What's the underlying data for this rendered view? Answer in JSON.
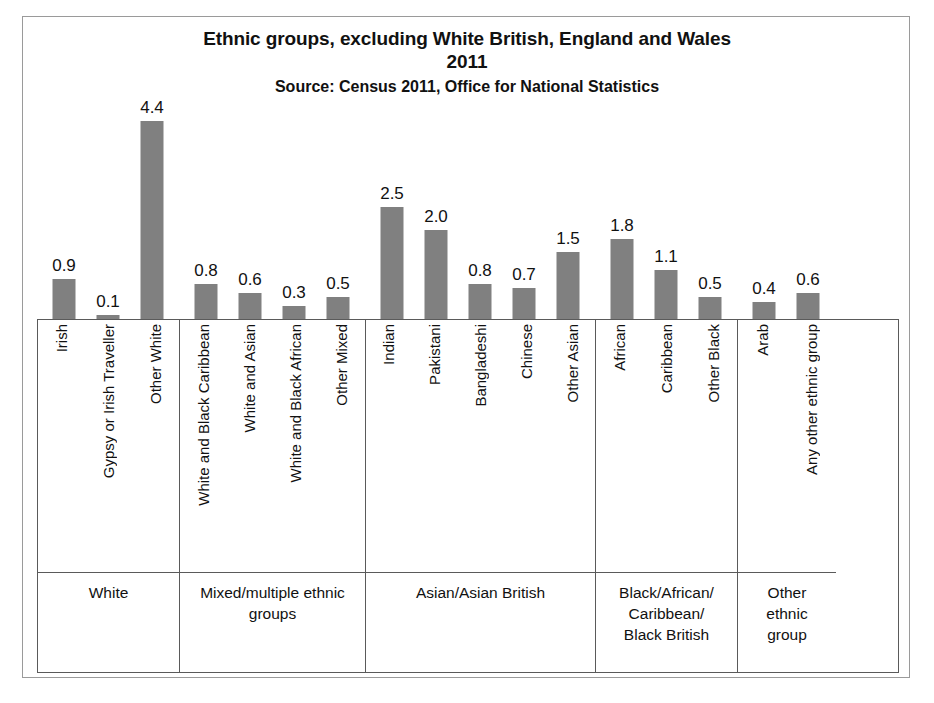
{
  "chart_data": {
    "type": "bar",
    "title": "Ethnic groups, excluding White British, England and Wales\n2011",
    "subtitle": "Source: Census 2011, Office for National Statistics",
    "xlabel": "",
    "ylabel": "",
    "ylim": [
      0,
      4.4
    ],
    "grid": false,
    "legend": "none",
    "value_format": "one-decimal percentage",
    "bar_color": "#808080",
    "categories": [
      "Irish",
      "Gypsy or Irish Traveller",
      "Other White",
      "White and Black Caribbean",
      "White and Asian",
      "White and Black African",
      "Other Mixed",
      "Indian",
      "Pakistani",
      "Bangladeshi",
      "Chinese",
      "Other Asian",
      "African",
      "Caribbean",
      "Other Black",
      "Arab",
      "Any other ethnic group"
    ],
    "values": [
      0.9,
      0.1,
      4.4,
      0.8,
      0.6,
      0.3,
      0.5,
      2.5,
      2.0,
      0.8,
      0.7,
      1.5,
      1.8,
      1.1,
      0.5,
      0.4,
      0.6
    ],
    "value_labels": [
      "0.9",
      "0.1",
      "4.4",
      "0.8",
      "0.6",
      "0.3",
      "0.5",
      "2.5",
      "2.0",
      "0.8",
      "0.7",
      "1.5",
      "1.8",
      "1.1",
      "0.5",
      "0.4",
      "0.6"
    ],
    "groups": [
      {
        "label": "White",
        "categories": [
          "Irish",
          "Gypsy or Irish Traveller",
          "Other White"
        ],
        "values": [
          0.9,
          0.1,
          4.4
        ],
        "value_labels": [
          "0.9",
          "0.1",
          "4.4"
        ]
      },
      {
        "label": "Mixed/multiple ethnic\ngroups",
        "categories": [
          "White and Black Caribbean",
          "White and Asian",
          "White and Black African",
          "Other Mixed"
        ],
        "values": [
          0.8,
          0.6,
          0.3,
          0.5
        ],
        "value_labels": [
          "0.8",
          "0.6",
          "0.3",
          "0.5"
        ]
      },
      {
        "label": "Asian/Asian British",
        "categories": [
          "Indian",
          "Pakistani",
          "Bangladeshi",
          "Chinese",
          "Other Asian"
        ],
        "values": [
          2.5,
          2.0,
          0.8,
          0.7,
          1.5
        ],
        "value_labels": [
          "2.5",
          "2.0",
          "0.8",
          "0.7",
          "1.5"
        ]
      },
      {
        "label": "Black/African/\nCaribbean/\nBlack British",
        "categories": [
          "African",
          "Caribbean",
          "Other Black"
        ],
        "values": [
          1.8,
          1.1,
          0.5
        ],
        "value_labels": [
          "1.8",
          "1.1",
          "0.5"
        ]
      },
      {
        "label": "Other\nethnic\ngroup",
        "categories": [
          "Arab",
          "Any other ethnic group"
        ],
        "values": [
          0.4,
          0.6
        ],
        "value_labels": [
          "0.4",
          "0.6"
        ]
      }
    ]
  },
  "chart": {
    "title": "Ethnic groups, excluding White British, England and Wales\n2011",
    "source": "Source: Census 2011, Office for National Statistics"
  }
}
